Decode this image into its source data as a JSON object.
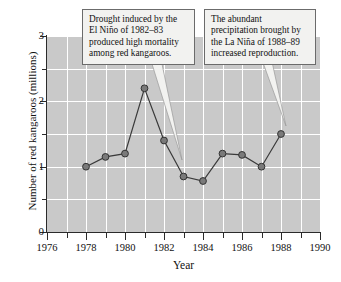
{
  "chart_data": {
    "type": "line",
    "title": "",
    "xlabel": "Year",
    "ylabel": "Number of red kangaroos (millions)",
    "xlim": [
      1976,
      1990
    ],
    "ylim": [
      0,
      3
    ],
    "x_ticks_major": [
      1976,
      1978,
      1980,
      1982,
      1984,
      1986,
      1988,
      1990
    ],
    "x_ticks_minor": [
      1977,
      1979,
      1981,
      1983,
      1985,
      1987,
      1989
    ],
    "y_ticks_major": [
      0,
      1,
      2,
      3
    ],
    "y_ticks_minor": [
      0.5,
      1.5,
      2.5
    ],
    "grid": true,
    "grid_color": "#ffffff",
    "plot_background": "#c9c9c9",
    "marker_fill": "#7a7a7a",
    "marker_edge": "#333333",
    "line_color": "#3a3a3a",
    "legend": null,
    "x": [
      1978,
      1979,
      1980,
      1981,
      1982,
      1983,
      1984,
      1985,
      1986,
      1987,
      1988
    ],
    "values": [
      1.0,
      1.15,
      1.2,
      2.2,
      1.4,
      0.85,
      0.78,
      1.2,
      1.18,
      1.0,
      1.5
    ],
    "annotations": [
      {
        "name": "drought-callout",
        "text": "Drought induced by the El Niño of 1982–83 produced high mortality among red kangaroos.",
        "lines": [
          "Drought induced by the",
          "El Niño of 1982–83",
          "produced high mortality",
          "among red kangaroos."
        ],
        "points_to_year": 1983
      },
      {
        "name": "precipitation-callout",
        "text": "The abundant precipitation brought by the La Niña of 1988–89 increased reproduction.",
        "lines": [
          "The abundant",
          "precipitation brought by",
          "the La Niña of 1988–89",
          "increased reproduction."
        ],
        "points_to_year": 1988
      }
    ]
  },
  "axis": {
    "y_label": "Number of red kangaroos (millions)",
    "x_label": "Year",
    "y_tick_labels": [
      "0",
      "1",
      "2",
      "3"
    ],
    "x_tick_labels": [
      "1976",
      "1978",
      "1980",
      "1982",
      "1984",
      "1986",
      "1988",
      "1990"
    ]
  }
}
